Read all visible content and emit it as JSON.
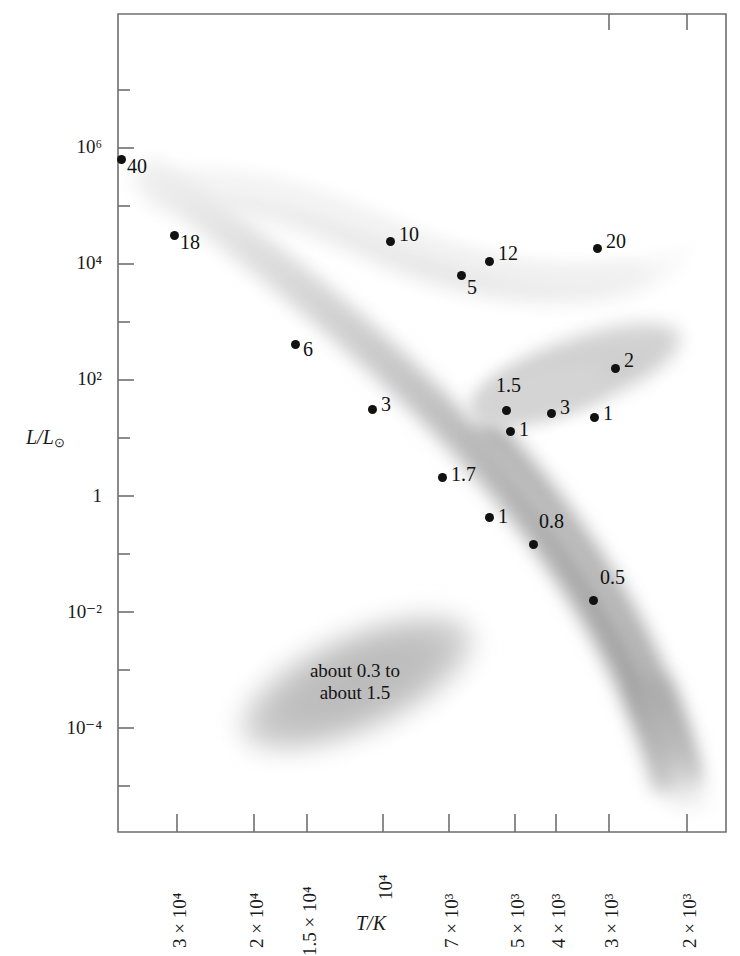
{
  "chart_data": {
    "type": "scatter",
    "title": "",
    "xlabel": "T/K",
    "ylabel": "L/L⊙",
    "xscale": "log-reversed",
    "yscale": "log",
    "grid": false,
    "legend": "none",
    "xlim": [
      38000,
      1700
    ],
    "ylim": [
      1e-05,
      30000000.0
    ],
    "xticks": [
      {
        "label": "3 × 10⁴",
        "value": 30000,
        "px": 177
      },
      {
        "label": "2 × 10⁴",
        "value": 20000,
        "px": 254
      },
      {
        "label": "1.5 × 10⁴",
        "value": 15000,
        "px": 307
      },
      {
        "label": "10⁴",
        "value": 10000,
        "px": 383
      },
      {
        "label": "7 × 10³",
        "value": 7000,
        "px": 449
      },
      {
        "label": "5 × 10³",
        "value": 5000,
        "px": 515
      },
      {
        "label": "4 × 10³",
        "value": 4000,
        "px": 556
      },
      {
        "label": "3 × 10³",
        "value": 3000,
        "px": 609
      },
      {
        "label": "2 × 10³",
        "value": 2000,
        "px": 687
      }
    ],
    "yticks": [
      {
        "label": "10⁶",
        "value": 1000000,
        "px": 148
      },
      {
        "label": "10⁴",
        "value": 10000,
        "px": 264
      },
      {
        "label": "10²",
        "value": 100,
        "px": 380
      },
      {
        "label": "1",
        "value": 1,
        "px": 496
      },
      {
        "label": "10⁻²",
        "value": 0.01,
        "px": 612
      },
      {
        "label": "10⁻⁴",
        "value": 0.0001,
        "px": 728
      }
    ],
    "points": [
      {
        "label": "40",
        "mass": 40,
        "x_px": 121,
        "y_px": 159,
        "T": 38000,
        "L": 500000,
        "group": "supergiants",
        "label_dx": 6,
        "label_dy": 6
      },
      {
        "label": "18",
        "mass": 18,
        "x_px": 174,
        "y_px": 235,
        "T": 30500,
        "L": 38000,
        "group": "main-sequence-upper",
        "label_dx": 6,
        "label_dy": 6
      },
      {
        "label": "10",
        "mass": 10,
        "x_px": 390,
        "y_px": 241,
        "T": 9800,
        "L": 29000,
        "group": "supergiants",
        "label_dx": 9,
        "label_dy": -8
      },
      {
        "label": "5",
        "mass": 5,
        "x_px": 461,
        "y_px": 275,
        "T": 6600,
        "L": 9000,
        "group": "supergiants",
        "label_dx": 0,
        "label_dy": 11
      },
      {
        "label": "12",
        "mass": 12,
        "x_px": 489,
        "y_px": 261,
        "T": 5700,
        "L": 16000,
        "group": "supergiants",
        "label_dx": 9,
        "label_dy": -9
      },
      {
        "label": "20",
        "mass": 20,
        "x_px": 597,
        "y_px": 248,
        "T": 3200,
        "L": 22000,
        "group": "supergiants",
        "label_dx": 9,
        "label_dy": -8
      },
      {
        "label": "6",
        "mass": 6,
        "x_px": 295,
        "y_px": 344,
        "T": 16500,
        "L": 650,
        "group": "main-sequence",
        "label_dx": 8,
        "label_dy": 4
      },
      {
        "label": "2",
        "mass": 2,
        "x_px": 615,
        "y_px": 368,
        "T": 2950,
        "L": 300,
        "group": "giants",
        "label_dx": 9,
        "label_dy": -9
      },
      {
        "label": "1.5",
        "mass": 1.5,
        "x_px": 506,
        "y_px": 410,
        "T": 5200,
        "L": 70,
        "group": "giants",
        "label_dx": -10,
        "label_dy": -26
      },
      {
        "label": "3",
        "mass": 3,
        "x_px": 372,
        "y_px": 409,
        "T": 10300,
        "L": 72,
        "group": "main-sequence",
        "label_dx": 9,
        "label_dy": -6
      },
      {
        "label": "3",
        "mass": 3,
        "x_px": 551,
        "y_px": 413,
        "T": 4100,
        "L": 62,
        "group": "giants",
        "label_dx": 9,
        "label_dy": -7
      },
      {
        "label": "1",
        "mass": 1,
        "x_px": 594,
        "y_px": 417,
        "T": 3200,
        "L": 55,
        "group": "giants",
        "label_dx": 9,
        "label_dy": -5
      },
      {
        "label": "1",
        "mass": 1,
        "x_px": 510,
        "y_px": 431,
        "T": 5100,
        "L": 35,
        "group": "giants",
        "label_dx": 9,
        "label_dy": -3
      },
      {
        "label": "1.7",
        "mass": 1.7,
        "x_px": 442,
        "y_px": 477,
        "T": 7100,
        "L": 5,
        "group": "main-sequence",
        "label_dx": 9,
        "label_dy": -4
      },
      {
        "label": "1",
        "mass": 1,
        "x_px": 489,
        "y_px": 517,
        "T": 5800,
        "L": 1.2,
        "group": "main-sequence",
        "label_dx": 9,
        "label_dy": -2
      },
      {
        "label": "0.8",
        "mass": 0.8,
        "x_px": 533,
        "y_px": 544,
        "T": 4800,
        "L": 0.45,
        "group": "main-sequence",
        "label_dx": 6,
        "label_dy": -24
      },
      {
        "label": "0.5",
        "mass": 0.5,
        "x_px": 593,
        "y_px": 600,
        "T": 3300,
        "L": 0.055,
        "group": "main-sequence",
        "label_dx": 7,
        "label_dy": -24
      }
    ],
    "regions": [
      {
        "name": "supergiants-band",
        "label": ""
      },
      {
        "name": "main-sequence-band",
        "label": ""
      },
      {
        "name": "giants-band",
        "label": ""
      },
      {
        "name": "white-dwarfs-band",
        "label": "about 0.3 to\nabout 1.5"
      }
    ],
    "annotations": [
      {
        "name": "white-dwarf-mass-range",
        "line1": "about 0.3 to",
        "line2": "about 1.5",
        "x_px": 355,
        "y_px": 680
      }
    ]
  },
  "axes": {
    "y_title_main": "L/L",
    "y_title_sub": "⊙",
    "x_title": "T/K"
  },
  "frame": {
    "left_px": 118,
    "right_px": 726,
    "top_px": 14,
    "bottom_px": 832,
    "line_color": "#6f6f6f"
  }
}
